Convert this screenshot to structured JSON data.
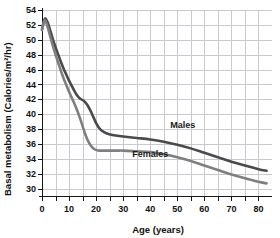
{
  "chart_data": {
    "type": "line",
    "title": "",
    "xlabel": "Age (years)",
    "ylabel": "Basal metabolism (Calories/m²/hr)",
    "xlim": [
      0,
      85
    ],
    "ylim": [
      29,
      54
    ],
    "xticks": [
      0,
      10,
      20,
      30,
      40,
      50,
      60,
      70,
      80
    ],
    "xtick_labels": [
      "0",
      "10",
      "20",
      "30",
      "40",
      "50",
      "60",
      "70",
      "80"
    ],
    "xminor_step": 5,
    "yticks": [
      30,
      32,
      34,
      36,
      38,
      40,
      42,
      44,
      46,
      48,
      50,
      52,
      54
    ],
    "ytick_labels": [
      "30",
      "32",
      "34",
      "36",
      "38",
      "40",
      "42",
      "44",
      "46",
      "48",
      "50",
      "52",
      "54"
    ],
    "grid": true,
    "grid_color": "#c9c9cf",
    "legend_position": "inline-annotations",
    "series": [
      {
        "name": "Males",
        "color": "#4a4a4a",
        "width": 2.6,
        "label_x": 52,
        "label_y": 38.1,
        "x": [
          0,
          1,
          2,
          3,
          4,
          5,
          6,
          7,
          8,
          9,
          10,
          11,
          12,
          13,
          14,
          15,
          16,
          17,
          18,
          19,
          20,
          21,
          22,
          24,
          26,
          28,
          30,
          35,
          40,
          45,
          50,
          55,
          60,
          65,
          70,
          75,
          80,
          83
        ],
        "y": [
          51.4,
          52.8,
          52.4,
          51.3,
          50.1,
          49.0,
          48.0,
          47.0,
          46.1,
          45.3,
          44.5,
          43.8,
          43.1,
          42.5,
          42.1,
          41.9,
          41.6,
          41.1,
          40.4,
          39.6,
          38.8,
          38.2,
          37.8,
          37.4,
          37.2,
          37.1,
          37.0,
          36.8,
          36.6,
          36.3,
          35.9,
          35.4,
          34.8,
          34.2,
          33.6,
          33.1,
          32.6,
          32.4
        ]
      },
      {
        "name": "Females",
        "color": "#7f7f7f",
        "width": 2.6,
        "label_x": 40,
        "label_y": 34.2,
        "x": [
          0,
          1,
          2,
          3,
          4,
          5,
          6,
          7,
          8,
          9,
          10,
          11,
          12,
          13,
          14,
          15,
          16,
          17,
          18,
          19,
          20,
          21,
          22,
          24,
          26,
          28,
          30,
          35,
          40,
          45,
          50,
          55,
          60,
          65,
          70,
          75,
          80,
          83
        ],
        "y": [
          51.3,
          52.6,
          51.8,
          50.5,
          49.2,
          48.0,
          46.9,
          45.8,
          44.8,
          43.9,
          43.0,
          42.2,
          41.4,
          40.5,
          39.5,
          38.4,
          37.3,
          36.4,
          35.8,
          35.4,
          35.2,
          35.1,
          35.1,
          35.1,
          35.1,
          35.1,
          35.1,
          35.0,
          34.9,
          34.6,
          34.2,
          33.7,
          33.1,
          32.5,
          31.9,
          31.4,
          30.9,
          30.7
        ]
      }
    ]
  },
  "labels": {
    "males": "Males",
    "females": "Females",
    "x_axis_title": "Age (years)",
    "y_axis_title": "Basal metabolism (Calories/m²/hr)"
  }
}
